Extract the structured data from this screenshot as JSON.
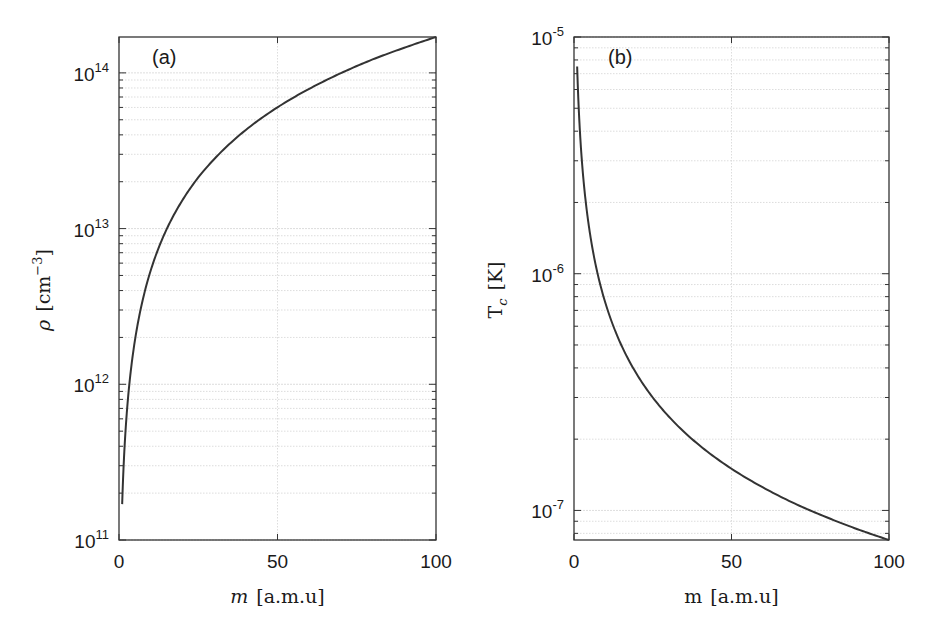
{
  "chart_data": [
    {
      "type": "line",
      "panel_label": "(a)",
      "xlabel_var": "m",
      "xlabel_unit": "[a.m.u]",
      "ylabel_var": "ρ",
      "ylabel_unit": "[cm",
      "ylabel_unit_exp": "−3",
      "ylabel_unit_close": "]",
      "xlim": [
        0,
        100
      ],
      "ylim": [
        100000000000.0,
        170000000000000.0
      ],
      "yscale": "log",
      "grid": true,
      "xticks": [
        0,
        50,
        100
      ],
      "xtick_labels": [
        "0",
        "50",
        "100"
      ],
      "yticks": [
        100000000000.0,
        1000000000000.0,
        10000000000000.0,
        100000000000000.0
      ],
      "ytick_labels": [
        {
          "base": "10",
          "exp": "11"
        },
        {
          "base": "10",
          "exp": "12"
        },
        {
          "base": "10",
          "exp": "13"
        },
        {
          "base": "10",
          "exp": "14"
        }
      ],
      "series": [
        {
          "name": "rho",
          "x": [
            1,
            2,
            3,
            5,
            7,
            10,
            13,
            15,
            20,
            25,
            30,
            40,
            50,
            60,
            70,
            80,
            90,
            100
          ],
          "y": [
            170000000000.0,
            481000000000.0,
            883000000000.0,
            1900000000000.0,
            3150000000000.0,
            5380000000000.0,
            7970000000000.0,
            9880000000000.0,
            15200000000000.0,
            21300000000000.0,
            27900000000000.0,
            43000000000000.0,
            60100000000000.0,
            79000000000000.0,
            99600000000000.0,
            122000000000000.0,
            145000000000000.0,
            170000000000000.0
          ]
        }
      ]
    },
    {
      "type": "line",
      "panel_label": "(b)",
      "xlabel_var": "m",
      "xlabel_unit": "[a.m.u]",
      "ylabel_var": "T",
      "ylabel_sub": "c",
      "ylabel_unit": "[K]",
      "xlim": [
        0,
        100
      ],
      "ylim": [
        7.5e-08,
        1e-05
      ],
      "yscale": "log",
      "grid": true,
      "xticks": [
        0,
        50,
        100
      ],
      "xtick_labels": [
        "0",
        "50",
        "100"
      ],
      "yticks": [
        1e-07,
        1e-06,
        1e-05
      ],
      "ytick_labels": [
        {
          "base": "10",
          "exp": "-7"
        },
        {
          "base": "10",
          "exp": "-6"
        },
        {
          "base": "10",
          "exp": "-5"
        }
      ],
      "series": [
        {
          "name": "Tc",
          "x": [
            1,
            1.5,
            2,
            3,
            4,
            5,
            7,
            10,
            13,
            15,
            20,
            25,
            30,
            40,
            50,
            60,
            70,
            80,
            90,
            100
          ],
          "y": [
            7.5e-06,
            5e-06,
            3.75e-06,
            2.5e-06,
            1.875e-06,
            1.5e-06,
            1.07e-06,
            7.5e-07,
            5.77e-07,
            5e-07,
            3.75e-07,
            3e-07,
            2.5e-07,
            1.875e-07,
            1.5e-07,
            1.25e-07,
            1.07e-07,
            9.38e-08,
            8.33e-08,
            7.5e-08
          ]
        }
      ]
    }
  ],
  "colors": {
    "line": "#333333",
    "grid": "#d4d4d4",
    "frame": "#333333"
  }
}
